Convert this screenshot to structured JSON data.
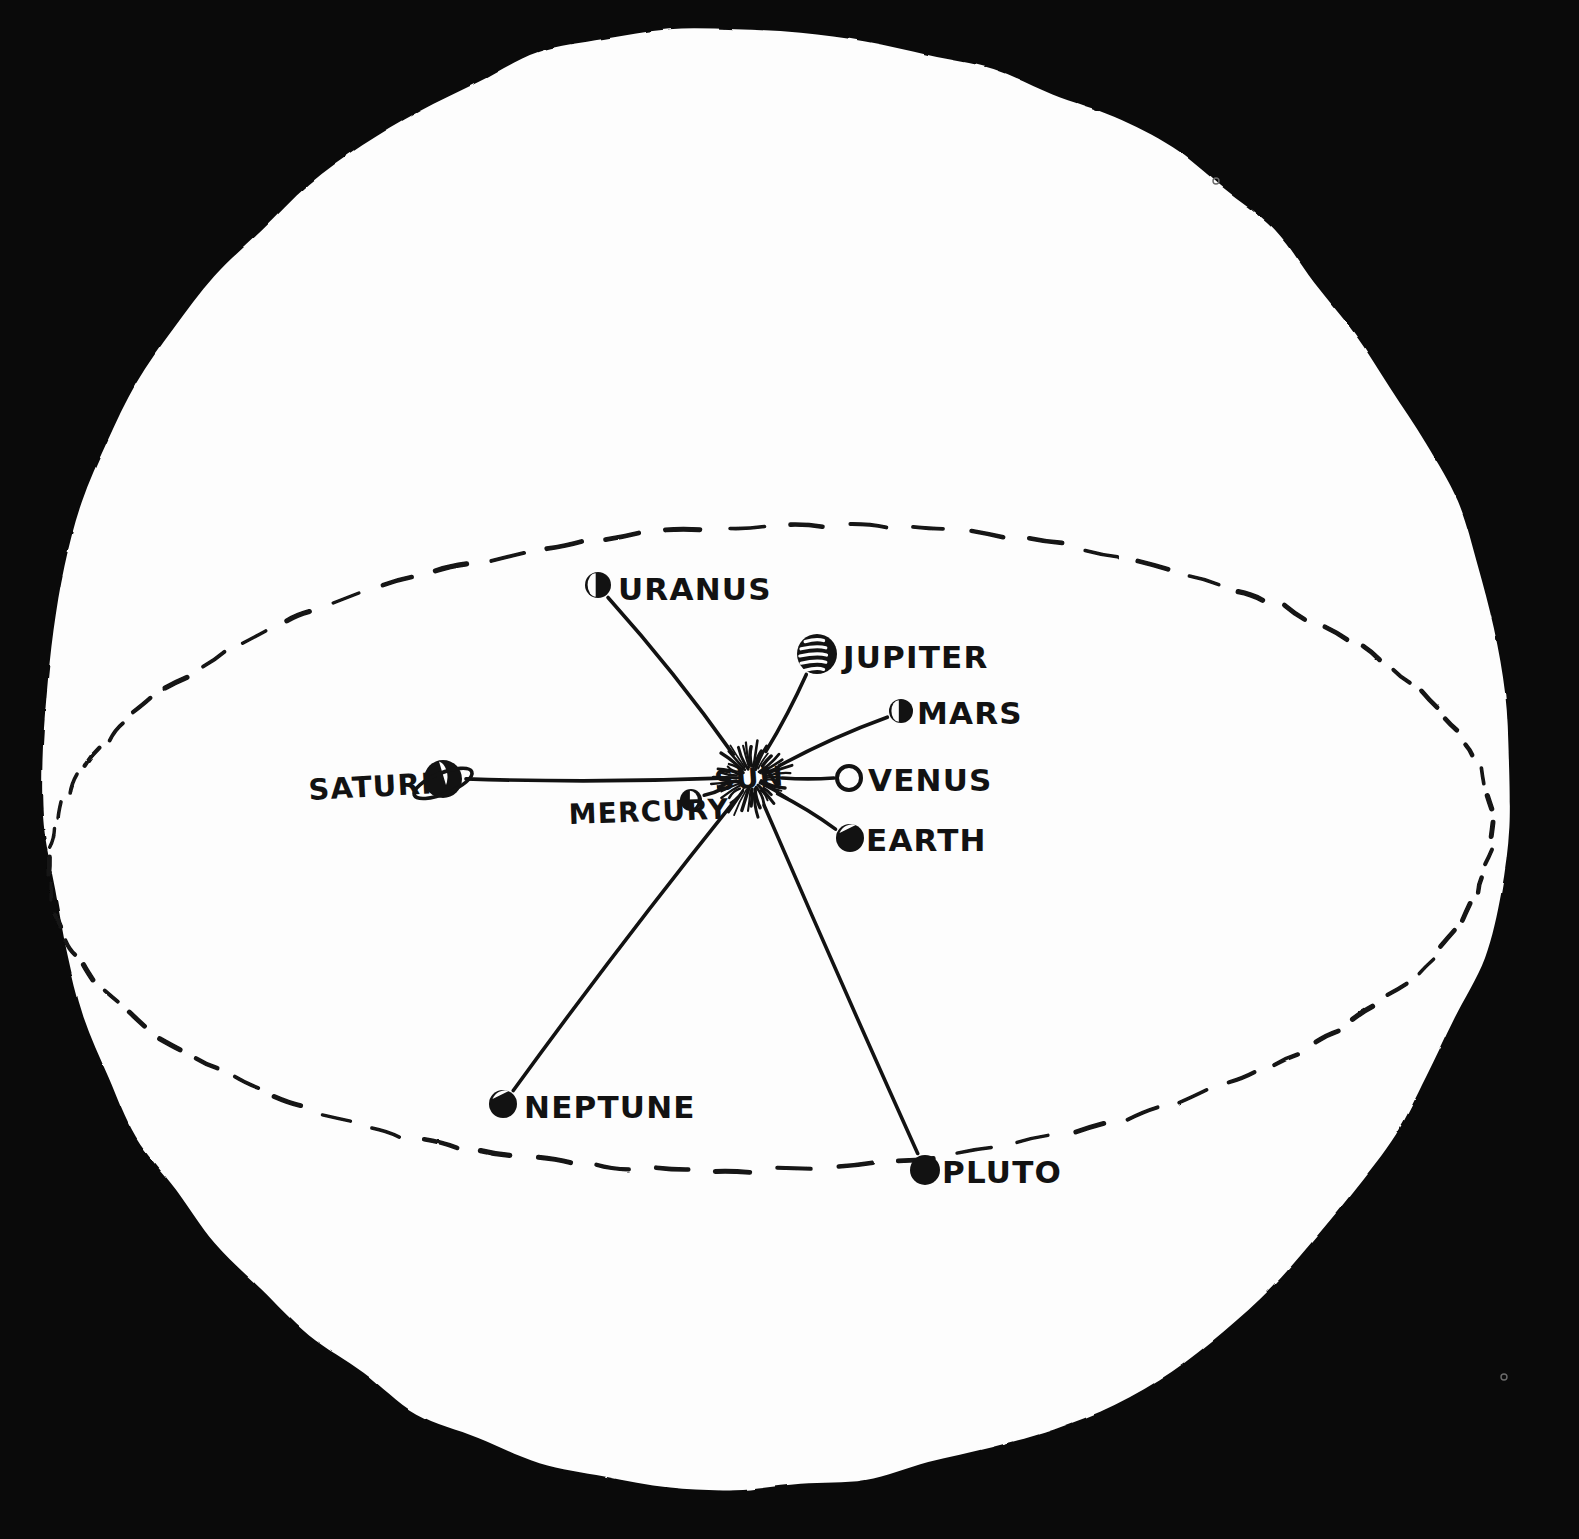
{
  "image": {
    "title": "Solar System diagram",
    "style": "hand-drawn ink illustration, white disc on black background",
    "background_color": "#0a0a0a",
    "disc_color": "#fdfdfd",
    "ink_color": "#121212"
  },
  "center": {
    "label": "SUN",
    "name": "sun",
    "x": 752,
    "y": 778
  },
  "orbit": {
    "name": "dashed-orbit-ellipse",
    "style": "dashed",
    "cx": 770,
    "cy": 848,
    "rx": 722,
    "ry": 322,
    "rotation_deg": -2
  },
  "planets": [
    {
      "name": "uranus",
      "label": "URANUS",
      "glyph": "half-shaded-disc",
      "dot_x": 598,
      "dot_y": 585,
      "dot_r": 13,
      "label_x": 618,
      "label_y": 600,
      "label_size": 31
    },
    {
      "name": "jupiter",
      "label": "JUPITER",
      "glyph": "banded-disc",
      "dot_x": 817,
      "dot_y": 654,
      "dot_r": 20,
      "label_x": 843,
      "label_y": 668,
      "label_size": 31
    },
    {
      "name": "mars",
      "label": "MARS",
      "glyph": "half-shaded-disc",
      "dot_x": 901,
      "dot_y": 711,
      "dot_r": 12,
      "label_x": 917,
      "label_y": 724,
      "label_size": 31
    },
    {
      "name": "venus",
      "label": "VENUS",
      "glyph": "open-circle",
      "dot_x": 849,
      "dot_y": 778,
      "dot_r": 12,
      "label_x": 868,
      "label_y": 791,
      "label_size": 31
    },
    {
      "name": "earth",
      "label": "EARTH",
      "glyph": "shaded-disc",
      "dot_x": 850,
      "dot_y": 838,
      "dot_r": 14,
      "label_x": 866,
      "label_y": 851,
      "label_size": 31
    },
    {
      "name": "mercury",
      "label": "MERCURY",
      "glyph": "small-shaded-disc",
      "dot_x": 691,
      "dot_y": 800,
      "dot_r": 11,
      "label_x": 569,
      "label_y": 824,
      "label_size": 28,
      "label_anchor": "start"
    },
    {
      "name": "saturn",
      "label": "SATURN",
      "glyph": "ringed-disc",
      "dot_x": 443,
      "dot_y": 779,
      "dot_r": 20,
      "label_x": 309,
      "label_y": 800,
      "label_size": 29,
      "label_anchor": "start"
    },
    {
      "name": "neptune",
      "label": "NEPTUNE",
      "glyph": "shaded-disc",
      "dot_x": 503,
      "dot_y": 1104,
      "dot_r": 14,
      "label_x": 524,
      "label_y": 1118,
      "label_size": 31
    },
    {
      "name": "pluto",
      "label": "PLUTO",
      "glyph": "filled-disc",
      "dot_x": 925,
      "dot_y": 1170,
      "dot_r": 15,
      "label_x": 942,
      "label_y": 1183,
      "label_size": 31
    }
  ],
  "artifacts": [
    {
      "name": "speck-top-right",
      "x": 1216,
      "y": 181,
      "r": 3
    },
    {
      "name": "speck-bottom-right",
      "x": 1504,
      "y": 1377,
      "r": 3
    }
  ]
}
